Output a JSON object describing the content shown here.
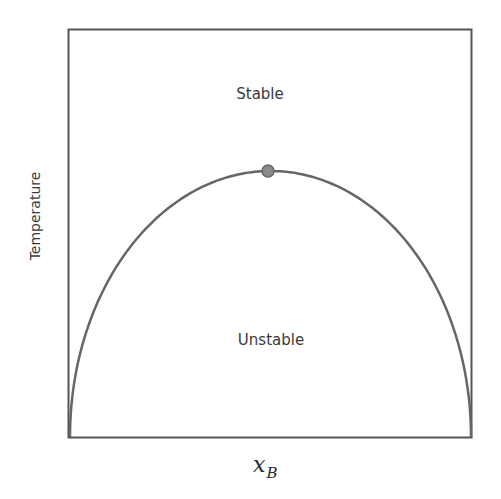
{
  "chart_data": {
    "type": "line",
    "title": "",
    "xlabel": "x_B",
    "xlabel_main": "x",
    "xlabel_sub": "B",
    "ylabel": "Temperature",
    "regions": {
      "above": "Stable",
      "below": "Unstable"
    },
    "curve": "spinodal dome (symmetric, max at x_B = 0.5)",
    "critical_point": {
      "x": 0.5,
      "y": 0.66
    },
    "x": [
      0.0,
      0.05,
      0.1,
      0.2,
      0.3,
      0.4,
      0.5,
      0.6,
      0.7,
      0.8,
      0.9,
      0.95,
      1.0
    ],
    "y": [
      0.0,
      0.29,
      0.4,
      0.53,
      0.61,
      0.65,
      0.66,
      0.65,
      0.61,
      0.53,
      0.4,
      0.29,
      0.0
    ],
    "xlim": [
      0,
      1
    ],
    "ylim": [
      0,
      1
    ],
    "grid": false,
    "legend": null,
    "colors": {
      "frame": "#555555",
      "curve": "#666666",
      "point": "#7a7a7a"
    }
  }
}
